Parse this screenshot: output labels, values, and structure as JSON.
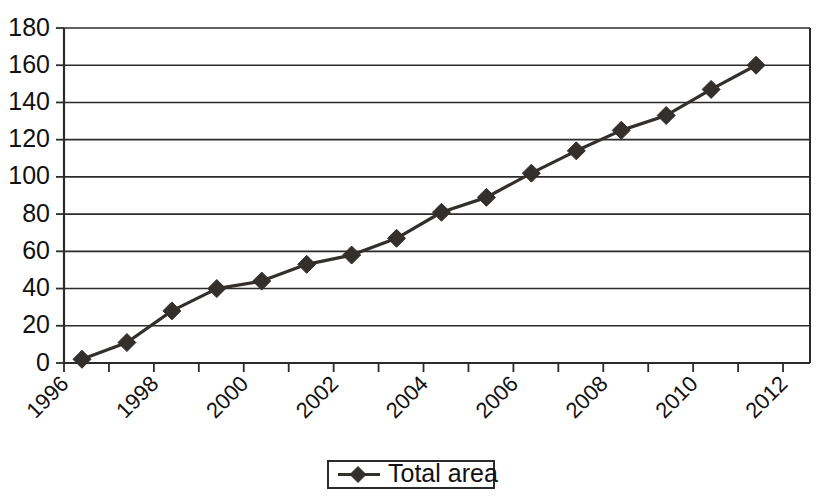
{
  "chart_data": {
    "type": "line",
    "title": "",
    "xlabel": "",
    "ylabel": "",
    "x": [
      1996,
      1997,
      1998,
      1999,
      2000,
      2001,
      2002,
      2003,
      2004,
      2005,
      2006,
      2007,
      2008,
      2009,
      2010,
      2011,
      2012
    ],
    "values": [
      2,
      11,
      28,
      40,
      44,
      53,
      58,
      67,
      81,
      89,
      102,
      114,
      125,
      133,
      147,
      160,
      160
    ],
    "series": [
      {
        "name": "Total area",
        "values": [
          2,
          11,
          28,
          40,
          44,
          53,
          58,
          67,
          81,
          89,
          102,
          114,
          125,
          133,
          147,
          160,
          160
        ]
      }
    ],
    "point_count": 16,
    "points": [
      {
        "x": 1996.4,
        "y": 2
      },
      {
        "x": 1997.4,
        "y": 11
      },
      {
        "x": 1998.4,
        "y": 28
      },
      {
        "x": 1999.4,
        "y": 40
      },
      {
        "x": 2000.4,
        "y": 44
      },
      {
        "x": 2001.4,
        "y": 53
      },
      {
        "x": 2002.4,
        "y": 58
      },
      {
        "x": 2003.4,
        "y": 67
      },
      {
        "x": 2004.4,
        "y": 81
      },
      {
        "x": 2005.4,
        "y": 89
      },
      {
        "x": 2006.4,
        "y": 102
      },
      {
        "x": 2007.4,
        "y": 114
      },
      {
        "x": 2008.4,
        "y": 125
      },
      {
        "x": 2009.4,
        "y": 133
      },
      {
        "x": 2010.4,
        "y": 147
      },
      {
        "x": 2011.4,
        "y": 160
      }
    ],
    "xlim": [
      1996,
      2012.6
    ],
    "ylim": [
      0,
      180
    ],
    "y_ticks": [
      0,
      20,
      40,
      60,
      80,
      100,
      120,
      140,
      160,
      180
    ],
    "y_tick_labels": [
      "0",
      "20",
      "40",
      "60",
      "80",
      "100",
      "120",
      "140",
      "160",
      "180"
    ],
    "x_ticks": [
      1996,
      1997,
      1998,
      1999,
      2000,
      2001,
      2002,
      2003,
      2004,
      2005,
      2006,
      2007,
      2008,
      2009,
      2010,
      2011,
      2012
    ],
    "x_tick_labels": [
      "1996",
      "",
      "1998",
      "",
      "2000",
      "",
      "2002",
      "",
      "2004",
      "",
      "2006",
      "",
      "2008",
      "",
      "2010",
      "",
      "2012"
    ],
    "x_tick_labels_visible": [
      "1996",
      "1998",
      "2000",
      "2002",
      "2004",
      "2006",
      "2008",
      "2010",
      "2012"
    ],
    "x_label_rotation": -45,
    "grid": {
      "horizontal": true,
      "vertical": false
    },
    "legend": {
      "position": "bottom-center",
      "entries": [
        {
          "label": "Total area",
          "marker": "diamond",
          "color": "#332f2c"
        }
      ]
    },
    "colors": {
      "line": "#332f2c",
      "marker": "#332f2c",
      "grid": "#2b2b2b",
      "axis": "#2b2b2b",
      "background": "#ffffff"
    }
  },
  "legend": {
    "total_area_label": "Total area"
  }
}
